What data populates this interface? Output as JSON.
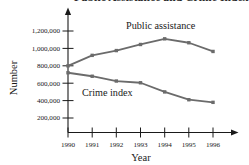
{
  "figure": {
    "title_partial": "Public Assistance and Crime Index in New York City",
    "background_color": "#ffffff",
    "line_color": "#6b6b6b",
    "axis_color": "#1a1a1a"
  },
  "axes": {
    "y_title": "Number",
    "x_title": "Year",
    "y_ticks": [
      "200,000",
      "400,000",
      "600,000",
      "800,000",
      "1,000,000",
      "1,200,000"
    ],
    "x_ticks": [
      "1990",
      "1991",
      "1992",
      "1993",
      "1994",
      "1995",
      "1996"
    ]
  },
  "labels": {
    "public_assistance": "Public assistance",
    "crime_index": "Crime index"
  },
  "chart_data": {
    "type": "line",
    "title": "Public Assistance and Crime Index in New York City",
    "xlabel": "Year",
    "ylabel": "Number",
    "x": [
      1990,
      1991,
      1992,
      1993,
      1994,
      1995,
      1996
    ],
    "categories": [
      "1990",
      "1991",
      "1992",
      "1993",
      "1994",
      "1995",
      "1996"
    ],
    "ylim": [
      0,
      1300000
    ],
    "xlim": [
      1990,
      1996
    ],
    "yticks": [
      200000,
      400000,
      600000,
      800000,
      1000000,
      1200000
    ],
    "ytick_labels": [
      "200,000",
      "400,000",
      "600,000",
      "800,000",
      "1,000,000",
      "1,200,000"
    ],
    "grid": false,
    "legend": "inline-annotations",
    "markers": true,
    "series": [
      {
        "name": "Public assistance",
        "color": "#6b6b6b",
        "values": [
          800000,
          920000,
          975000,
          1045000,
          1110000,
          1065000,
          965000
        ]
      },
      {
        "name": "Crime index",
        "color": "#6b6b6b",
        "values": [
          720000,
          680000,
          625000,
          605000,
          500000,
          410000,
          380000
        ]
      }
    ],
    "annotations": [
      {
        "text": "Public assistance",
        "x": 1993.1,
        "y": 1205000
      },
      {
        "text": "Crime index",
        "x": 1991.5,
        "y": 480000
      }
    ]
  }
}
